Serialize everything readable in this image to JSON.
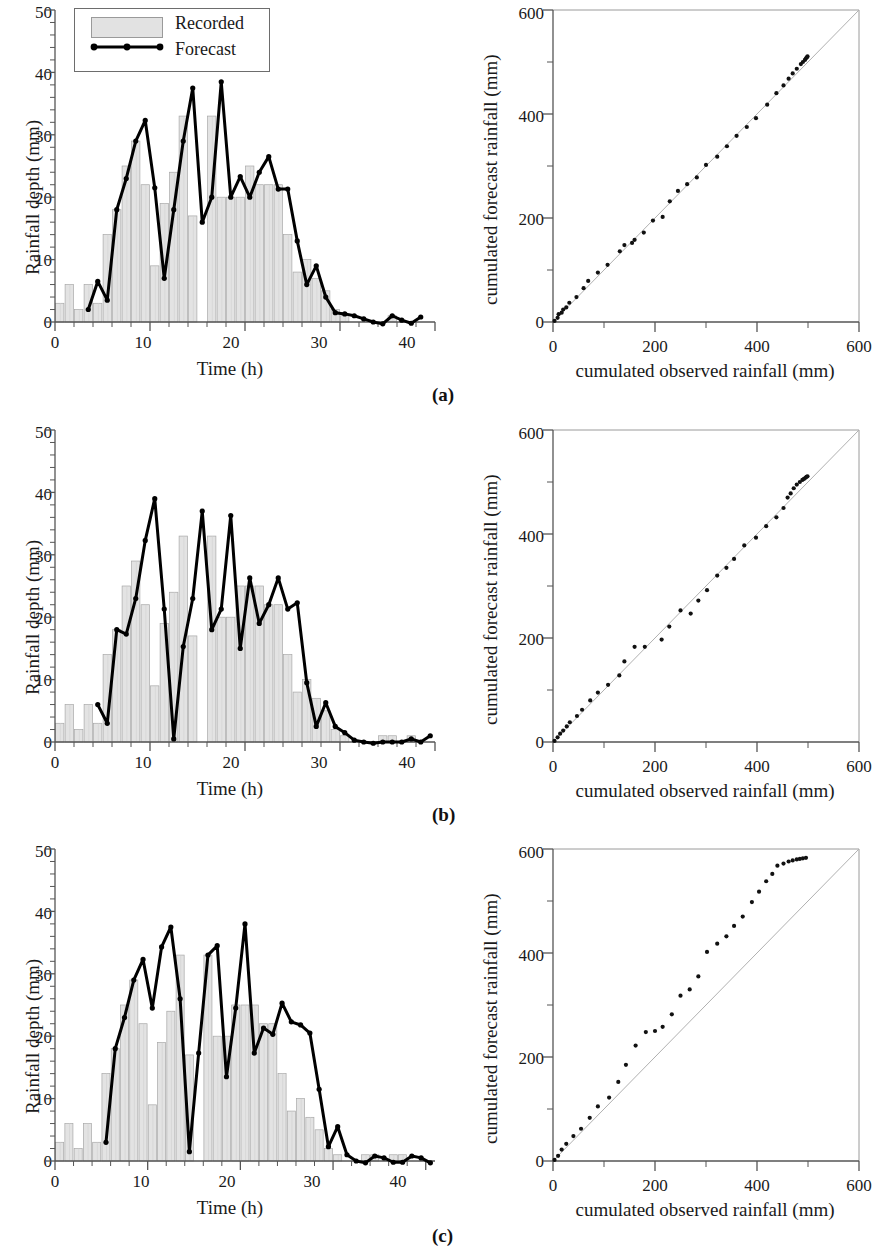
{
  "figure": {
    "panels": [
      {
        "id": "a",
        "label": "(a)"
      },
      {
        "id": "b",
        "label": "(b)"
      },
      {
        "id": "c",
        "label": "(c)"
      }
    ]
  },
  "legend": {
    "recorded_label": "Recorded",
    "forecast_label": "Forecast",
    "recorded_swatch_color": "#dcdcdc",
    "forecast_line_color": "#000000"
  },
  "chart_data": [
    {
      "panel": "a",
      "position": "left",
      "type": "bar",
      "title": "",
      "xlabel": "Time (h)",
      "ylabel": "Rainfall depth (mm)",
      "xlim": [
        0,
        40
      ],
      "ylim": [
        0,
        50
      ],
      "xticks": [
        0,
        10,
        20,
        30,
        40
      ],
      "yticks": [
        0,
        10,
        20,
        30,
        40,
        50
      ],
      "xminor_step": 2,
      "yminor_step": 2,
      "grid": false,
      "legend_position": "top-left",
      "categories": [
        1,
        2,
        3,
        4,
        5,
        6,
        7,
        8,
        9,
        10,
        11,
        12,
        13,
        14,
        15,
        16,
        17,
        18,
        19,
        20,
        21,
        22,
        23,
        24,
        25,
        26,
        27,
        28,
        29,
        30,
        31,
        32,
        33,
        34,
        35,
        36,
        37,
        38,
        39
      ],
      "series": [
        {
          "name": "Recorded",
          "kind": "bar",
          "values": [
            3,
            6,
            2,
            6,
            3,
            14,
            18,
            25,
            29,
            22,
            9,
            19,
            24,
            33,
            17,
            0,
            33,
            20,
            20,
            20,
            25,
            22,
            22,
            22,
            14,
            8,
            10,
            7,
            5,
            2,
            1,
            0,
            0,
            0,
            0,
            1,
            0,
            0,
            0
          ]
        },
        {
          "name": "Forecast",
          "kind": "line",
          "x": [
            4,
            5,
            6,
            7,
            8,
            9,
            10,
            11,
            12,
            13,
            14,
            15,
            16,
            17,
            18,
            19,
            20,
            21,
            22,
            23,
            24,
            25,
            26,
            27,
            28,
            29,
            30,
            31,
            32,
            33,
            34,
            35,
            36,
            37,
            38,
            39
          ],
          "values": [
            2,
            6.5,
            3.5,
            18,
            23,
            29,
            32.3,
            21.5,
            7,
            18,
            29,
            37.5,
            16,
            20,
            38.5,
            20,
            23.3,
            20,
            24,
            26.5,
            21.3,
            21.3,
            13,
            6,
            9,
            4,
            1.5,
            1.3,
            1,
            0.5,
            0,
            -0.3,
            1,
            0.3,
            -0.2,
            0.8
          ]
        }
      ]
    },
    {
      "panel": "a",
      "position": "right",
      "type": "scatter",
      "title": "",
      "xlabel": "cumulated observed rainfall (mm)",
      "ylabel": "cumulated forecast rainfall (mm)",
      "xlim": [
        0,
        600
      ],
      "ylim": [
        0,
        600
      ],
      "xticks": [
        0,
        200,
        400,
        600
      ],
      "yticks": [
        0,
        200,
        400,
        600
      ],
      "xminor_step": 100,
      "yminor_step": 100,
      "grid": false,
      "reference_line": {
        "from": [
          0,
          0
        ],
        "to": [
          600,
          600
        ],
        "label": "1:1"
      },
      "points": [
        [
          3,
          2
        ],
        [
          9,
          8
        ],
        [
          11,
          15
        ],
        [
          17,
          18
        ],
        [
          20,
          24
        ],
        [
          26,
          28
        ],
        [
          32,
          37
        ],
        [
          46,
          48
        ],
        [
          60,
          65
        ],
        [
          69,
          79
        ],
        [
          88,
          95
        ],
        [
          107,
          110
        ],
        [
          131,
          136
        ],
        [
          140,
          148
        ],
        [
          155,
          152
        ],
        [
          160,
          158
        ],
        [
          178,
          172
        ],
        [
          196,
          195
        ],
        [
          215,
          202
        ],
        [
          229,
          232
        ],
        [
          245,
          252
        ],
        [
          263,
          265
        ],
        [
          282,
          278
        ],
        [
          300,
          302
        ],
        [
          322,
          318
        ],
        [
          341,
          338
        ],
        [
          360,
          358
        ],
        [
          380,
          375
        ],
        [
          398,
          392
        ],
        [
          420,
          418
        ],
        [
          438,
          440
        ],
        [
          452,
          455
        ],
        [
          462,
          468
        ],
        [
          470,
          478
        ],
        [
          478,
          487
        ],
        [
          486,
          496
        ],
        [
          490,
          500
        ],
        [
          494,
          504
        ],
        [
          496,
          507
        ],
        [
          498,
          509
        ],
        [
          499,
          511
        ]
      ]
    },
    {
      "panel": "b",
      "position": "left",
      "type": "bar",
      "title": "",
      "xlabel": "Time (h)",
      "ylabel": "Rainfall depth (mm)",
      "xlim": [
        0,
        40
      ],
      "ylim": [
        0,
        50
      ],
      "xticks": [
        0,
        10,
        20,
        30,
        40
      ],
      "yticks": [
        0,
        10,
        20,
        30,
        40,
        50
      ],
      "xminor_step": 2,
      "yminor_step": 2,
      "grid": false,
      "legend_position": "none",
      "categories": [
        1,
        2,
        3,
        4,
        5,
        6,
        7,
        8,
        9,
        10,
        11,
        12,
        13,
        14,
        15,
        16,
        17,
        18,
        19,
        20,
        21,
        22,
        23,
        24,
        25,
        26,
        27,
        28,
        29,
        30,
        31,
        32,
        33,
        34,
        35,
        36,
        37,
        38,
        39
      ],
      "series": [
        {
          "name": "Recorded",
          "kind": "bar",
          "values": [
            3,
            6,
            2,
            6,
            3,
            14,
            18,
            25,
            29,
            22,
            9,
            19,
            24,
            33,
            17,
            0,
            33,
            20,
            20,
            25,
            25,
            25,
            22,
            22,
            14,
            8,
            10,
            7,
            5,
            2,
            1,
            0,
            0,
            0,
            1,
            1,
            0,
            1,
            0
          ]
        },
        {
          "name": "Forecast",
          "kind": "line",
          "x": [
            5,
            6,
            7,
            8,
            9,
            10,
            11,
            12,
            13,
            14,
            15,
            16,
            17,
            18,
            19,
            20,
            21,
            22,
            23,
            24,
            25,
            26,
            27,
            28,
            29,
            30,
            31,
            32,
            33,
            34,
            35,
            36,
            37,
            38,
            39,
            40
          ],
          "values": [
            6,
            3,
            18,
            17.3,
            23,
            32.3,
            39,
            21.3,
            0.5,
            15.3,
            23,
            37,
            18,
            21.3,
            36.3,
            15,
            26.3,
            19,
            22,
            26.3,
            21.3,
            22.3,
            9.5,
            2.5,
            6.3,
            2.5,
            1.5,
            0.3,
            0,
            -0.2,
            0,
            0,
            0,
            0.5,
            0,
            1
          ]
        }
      ]
    },
    {
      "panel": "b",
      "position": "right",
      "type": "scatter",
      "title": "",
      "xlabel": "cumulated observed rainfall (mm)",
      "ylabel": "cumulated forecast rainfall (mm)",
      "xlim": [
        0,
        600
      ],
      "ylim": [
        0,
        600
      ],
      "xticks": [
        0,
        200,
        400,
        600
      ],
      "yticks": [
        0,
        200,
        400,
        600
      ],
      "xminor_step": 100,
      "yminor_step": 100,
      "grid": false,
      "reference_line": {
        "from": [
          0,
          0
        ],
        "to": [
          600,
          600
        ],
        "label": "1:1"
      },
      "points": [
        [
          3,
          2
        ],
        [
          9,
          9
        ],
        [
          14,
          16
        ],
        [
          20,
          22
        ],
        [
          27,
          30
        ],
        [
          33,
          38
        ],
        [
          47,
          50
        ],
        [
          57,
          62
        ],
        [
          73,
          80
        ],
        [
          88,
          95
        ],
        [
          108,
          110
        ],
        [
          130,
          128
        ],
        [
          140,
          155
        ],
        [
          160,
          183
        ],
        [
          180,
          183
        ],
        [
          213,
          197
        ],
        [
          228,
          222
        ],
        [
          250,
          253
        ],
        [
          270,
          247
        ],
        [
          285,
          272
        ],
        [
          302,
          292
        ],
        [
          322,
          320
        ],
        [
          340,
          335
        ],
        [
          355,
          352
        ],
        [
          375,
          378
        ],
        [
          398,
          393
        ],
        [
          418,
          415
        ],
        [
          438,
          432
        ],
        [
          452,
          450
        ],
        [
          460,
          470
        ],
        [
          466,
          478
        ],
        [
          472,
          488
        ],
        [
          478,
          495
        ],
        [
          484,
          500
        ],
        [
          489,
          504
        ],
        [
          492,
          506
        ],
        [
          495,
          508
        ],
        [
          497,
          510
        ],
        [
          499,
          511
        ]
      ]
    },
    {
      "panel": "c",
      "position": "left",
      "type": "bar",
      "title": "",
      "xlabel": "Time (h)",
      "ylabel": "Rainfall depth (mm)",
      "xlim": [
        0,
        41
      ],
      "ylim": [
        0,
        50
      ],
      "xticks": [
        0,
        10,
        20,
        30,
        40
      ],
      "yticks": [
        0,
        10,
        20,
        30,
        40,
        50
      ],
      "xminor_step": 2,
      "yminor_step": 2,
      "grid": false,
      "legend_position": "none",
      "categories": [
        1,
        2,
        3,
        4,
        5,
        6,
        7,
        8,
        9,
        10,
        11,
        12,
        13,
        14,
        15,
        16,
        17,
        18,
        19,
        20,
        21,
        22,
        23,
        24,
        25,
        26,
        27,
        28,
        29,
        30,
        31,
        32,
        33,
        34,
        35,
        36,
        37,
        38,
        39,
        40,
        41
      ],
      "series": [
        {
          "name": "Recorded",
          "kind": "bar",
          "values": [
            3,
            6,
            2,
            6,
            3,
            14,
            18,
            25,
            29,
            22,
            9,
            19,
            24,
            33,
            17,
            0,
            33,
            20,
            20,
            25,
            25,
            25,
            22,
            22,
            14,
            8,
            10,
            7,
            5,
            2,
            1,
            0,
            0,
            1,
            1,
            0,
            1,
            1,
            0,
            0,
            0
          ]
        },
        {
          "name": "Forecast",
          "kind": "line",
          "x": [
            6,
            7,
            8,
            9,
            10,
            11,
            12,
            13,
            14,
            15,
            16,
            17,
            18,
            19,
            20,
            21,
            22,
            23,
            24,
            25,
            26,
            27,
            28,
            29,
            30,
            31,
            32,
            33,
            34,
            35,
            36,
            37,
            38,
            39,
            40,
            41
          ],
          "values": [
            3,
            18,
            23,
            29,
            32.3,
            24.5,
            34.3,
            37.5,
            26,
            1.5,
            17.3,
            33,
            34.5,
            13.5,
            24.5,
            38,
            17.3,
            21.3,
            20.3,
            25.3,
            22.3,
            21.8,
            20.5,
            11.5,
            2.3,
            5.5,
            1,
            0,
            -0.3,
            0.8,
            0.5,
            -0.2,
            -0.2,
            0.8,
            0.5,
            -0.3
          ]
        }
      ]
    },
    {
      "panel": "c",
      "position": "right",
      "type": "scatter",
      "title": "",
      "xlabel": "cumulated observed rainfall (mm)",
      "ylabel": "cumulated forecast rainfall (mm)",
      "xlim": [
        0,
        600
      ],
      "ylim": [
        0,
        600
      ],
      "xticks": [
        0,
        200,
        400,
        600
      ],
      "yticks": [
        0,
        200,
        400,
        600
      ],
      "xminor_step": 100,
      "yminor_step": 100,
      "grid": false,
      "reference_line": {
        "from": [
          0,
          0
        ],
        "to": [
          600,
          600
        ],
        "label": "1:1"
      },
      "points": [
        [
          3,
          2
        ],
        [
          10,
          10
        ],
        [
          17,
          22
        ],
        [
          26,
          33
        ],
        [
          40,
          48
        ],
        [
          55,
          62
        ],
        [
          72,
          83
        ],
        [
          88,
          105
        ],
        [
          110,
          122
        ],
        [
          128,
          152
        ],
        [
          143,
          185
        ],
        [
          162,
          222
        ],
        [
          182,
          248
        ],
        [
          200,
          250
        ],
        [
          215,
          258
        ],
        [
          233,
          282
        ],
        [
          250,
          318
        ],
        [
          268,
          330
        ],
        [
          285,
          355
        ],
        [
          302,
          402
        ],
        [
          322,
          418
        ],
        [
          340,
          432
        ],
        [
          355,
          452
        ],
        [
          372,
          470
        ],
        [
          390,
          498
        ],
        [
          404,
          518
        ],
        [
          418,
          538
        ],
        [
          430,
          552
        ],
        [
          440,
          568
        ],
        [
          452,
          572
        ],
        [
          462,
          576
        ],
        [
          470,
          578
        ],
        [
          478,
          580
        ],
        [
          484,
          581
        ],
        [
          490,
          582
        ],
        [
          496,
          583
        ]
      ]
    }
  ]
}
